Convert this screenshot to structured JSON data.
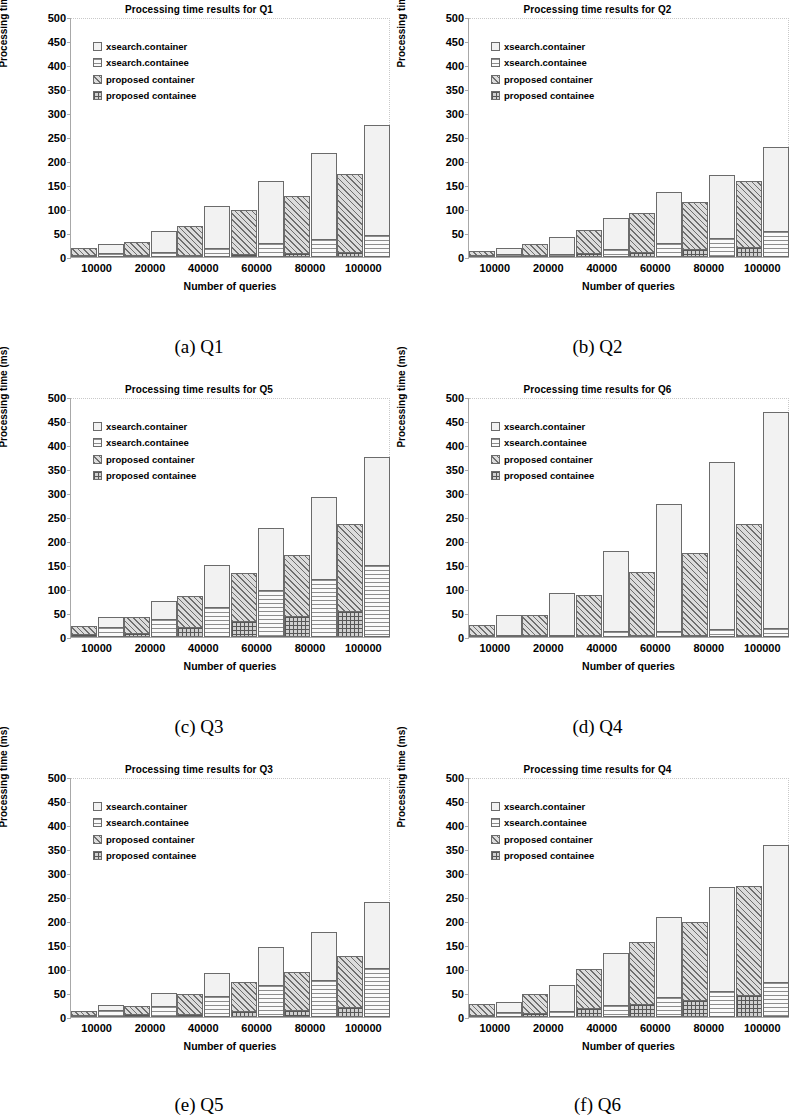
{
  "axis": {
    "ylabel": "Processing time (ms)",
    "xlabel": "Number of queries",
    "yticks": [
      "500",
      "450",
      "400",
      "350",
      "300",
      "250",
      "200",
      "150",
      "100",
      "50",
      "0"
    ],
    "xticks": [
      "10000",
      "20000",
      "40000",
      "60000",
      "80000",
      "100000"
    ],
    "ylim": [
      0,
      500
    ]
  },
  "legend": {
    "items": [
      {
        "label": "xsearch.container",
        "icon": "legend-swatch-dotted",
        "pattern": "p-xc"
      },
      {
        "label": "xsearch.containee",
        "icon": "legend-swatch-horizontal-lines",
        "pattern": "p-xe"
      },
      {
        "label": "proposed  container",
        "icon": "legend-swatch-diagonal-hatch",
        "pattern": "p-pc"
      },
      {
        "label": "proposed  containee",
        "icon": "legend-swatch-crosshatch",
        "pattern": "p-pe"
      }
    ]
  },
  "panels": [
    {
      "caption": "(a) Q1",
      "title": "Processing time results for Q1",
      "key": "q1"
    },
    {
      "caption": "(b) Q2",
      "title": "Processing time results for Q2",
      "key": "q2"
    },
    {
      "caption": "(c) Q3",
      "title": "Processing time results for Q5",
      "key": "q5"
    },
    {
      "caption": "(d) Q4",
      "title": "Processing time results for Q6",
      "key": "q6"
    },
    {
      "caption": "(e) Q5",
      "title": "Processing time results for Q3",
      "key": "q3"
    },
    {
      "caption": "(f) Q6",
      "title": "Processing time results for Q4",
      "key": "q4"
    }
  ],
  "chart_data": [
    {
      "type": "bar",
      "id": "q1",
      "title": "Processing time results for Q1",
      "xlabel": "Number of queries",
      "ylabel": "Processing time (ms)",
      "ylim": [
        0,
        500
      ],
      "grid": false,
      "legend_position": "inside-top-left",
      "stacked_pairs": true,
      "categories": [
        "10000",
        "20000",
        "40000",
        "60000",
        "80000",
        "100000"
      ],
      "series": [
        {
          "name": "proposed containee",
          "values": [
            2,
            3,
            5,
            6,
            8,
            11
          ]
        },
        {
          "name": "proposed container",
          "values": [
            16,
            31,
            64,
            98,
            128,
            172
          ]
        },
        {
          "name": "xsearch.containee",
          "values": [
            8,
            10,
            19,
            29,
            38,
            45
          ]
        },
        {
          "name": "xsearch.container",
          "values": [
            28,
            54,
            107,
            159,
            216,
            275
          ]
        }
      ]
    },
    {
      "type": "bar",
      "id": "q2",
      "title": "Processing time results for Q2",
      "xlabel": "Number of queries",
      "ylabel": "Processing time (ms)",
      "ylim": [
        0,
        500
      ],
      "grid": false,
      "legend_position": "inside-top-left",
      "stacked_pairs": true,
      "categories": [
        "10000",
        "20000",
        "40000",
        "60000",
        "80000",
        "100000"
      ],
      "series": [
        {
          "name": "proposed containee",
          "values": [
            4,
            5,
            8,
            11,
            16,
            21
          ]
        },
        {
          "name": "proposed container",
          "values": [
            12,
            28,
            56,
            91,
            115,
            159
          ]
        },
        {
          "name": "xsearch.containee",
          "values": [
            6,
            7,
            17,
            29,
            40,
            55
          ]
        },
        {
          "name": "xsearch.container",
          "values": [
            19,
            42,
            82,
            135,
            171,
            230
          ]
        }
      ]
    },
    {
      "type": "bar",
      "id": "q5",
      "title": "Processing time results for Q5",
      "xlabel": "Number of queries",
      "ylabel": "Processing time (ms)",
      "ylim": [
        0,
        500
      ],
      "grid": false,
      "legend_position": "inside-top-left",
      "stacked_pairs": true,
      "categories": [
        "10000",
        "20000",
        "40000",
        "60000",
        "80000",
        "100000"
      ],
      "series": [
        {
          "name": "proposed containee",
          "values": [
            6,
            9,
            21,
            33,
            44,
            55
          ]
        },
        {
          "name": "proposed container",
          "values": [
            23,
            42,
            85,
            134,
            170,
            236
          ]
        },
        {
          "name": "xsearch.containee",
          "values": [
            20,
            38,
            62,
            98,
            121,
            151
          ]
        },
        {
          "name": "xsearch.container",
          "values": [
            41,
            76,
            150,
            228,
            292,
            376
          ]
        }
      ]
    },
    {
      "type": "bar",
      "id": "q6",
      "title": "Processing time results for Q6",
      "xlabel": "Number of queries",
      "ylabel": "Processing time (ms)",
      "ylim": [
        0,
        500
      ],
      "grid": false,
      "legend_position": "inside-top-left",
      "stacked_pairs": true,
      "categories": [
        "10000",
        "20000",
        "40000",
        "60000",
        "80000",
        "100000"
      ],
      "series": [
        {
          "name": "proposed containee",
          "values": [
            1,
            1,
            2,
            2,
            3,
            3
          ]
        },
        {
          "name": "proposed container",
          "values": [
            22,
            43,
            85,
            134,
            173,
            234
          ]
        },
        {
          "name": "xsearch.containee",
          "values": [
            4,
            5,
            13,
            13,
            17,
            18
          ]
        },
        {
          "name": "xsearch.container",
          "values": [
            45,
            91,
            180,
            278,
            364,
            468
          ]
        }
      ]
    },
    {
      "type": "bar",
      "id": "q3",
      "title": "Processing time results for Q3",
      "xlabel": "Number of queries",
      "ylabel": "Processing time (ms)",
      "ylim": [
        0,
        500
      ],
      "grid": false,
      "legend_position": "inside-top-left",
      "stacked_pairs": true,
      "categories": [
        "10000",
        "20000",
        "40000",
        "60000",
        "80000",
        "100000"
      ],
      "series": [
        {
          "name": "proposed containee",
          "values": [
            3,
            6,
            7,
            12,
            15,
            20
          ]
        },
        {
          "name": "proposed container",
          "values": [
            11,
            24,
            48,
            74,
            93,
            127
          ]
        },
        {
          "name": "xsearch.containee",
          "values": [
            15,
            23,
            44,
            66,
            77,
            102
          ]
        },
        {
          "name": "xsearch.container",
          "values": [
            25,
            51,
            91,
            146,
            178,
            240
          ]
        }
      ]
    },
    {
      "type": "bar",
      "id": "q4",
      "title": "Processing time results for Q4",
      "xlabel": "Number of queries",
      "ylabel": "Processing time (ms)",
      "ylim": [
        0,
        500
      ],
      "grid": false,
      "legend_position": "inside-top-left",
      "stacked_pairs": true,
      "categories": [
        "10000",
        "20000",
        "40000",
        "60000",
        "80000",
        "100000"
      ],
      "series": [
        {
          "name": "proposed containee",
          "values": [
            4,
            9,
            18,
            28,
            36,
            46
          ]
        },
        {
          "name": "proposed container",
          "values": [
            26,
            48,
            100,
            156,
            199,
            273
          ]
        },
        {
          "name": "xsearch.containee",
          "values": [
            11,
            12,
            25,
            42,
            55,
            72
          ]
        },
        {
          "name": "xsearch.container",
          "values": [
            32,
            66,
            134,
            208,
            271,
            358
          ]
        }
      ]
    }
  ]
}
